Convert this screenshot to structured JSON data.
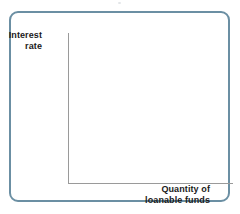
{
  "figure": {
    "name": "loanable-funds-market-blank-graph",
    "frame_color": "#6b8fa3",
    "axis_color": "#9a9a9a",
    "text_color": "#1a1a1a",
    "background": "#ffffff"
  },
  "chart_data": {
    "type": "line",
    "title": "",
    "subtitle": "",
    "xlabel": "Quantity of loanable funds",
    "ylabel": "Interest rate",
    "xlabel_lines": [
      "Quantity of",
      "loanable funds"
    ],
    "ylabel_lines": [
      "Interest",
      "rate"
    ],
    "series": [],
    "x": [],
    "categories": [],
    "values": [],
    "xtick_labels": [],
    "ytick_labels": [],
    "xlim": null,
    "ylim": null,
    "grid": false,
    "legend": false,
    "legend_position": "none",
    "annotations": []
  }
}
